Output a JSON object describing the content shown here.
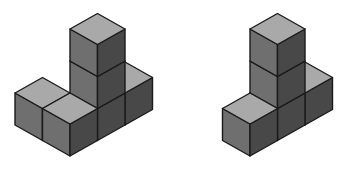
{
  "diagram": {
    "colors": {
      "background": "#ffffff",
      "top": "#a9a9a9",
      "left": "#6f6f6f",
      "right": "#484848",
      "outline": "#1a1a1a"
    },
    "projection": {
      "axis_a": [
        27.5,
        -15.5
      ],
      "axis_b": [
        -27.5,
        -15.5
      ],
      "axis_up": [
        0,
        -32
      ]
    },
    "figures": [
      {
        "name": "left-figure",
        "origin": [
          70,
          156
        ],
        "cubes": [
          [
            0,
            1,
            0
          ],
          [
            0,
            0,
            0
          ],
          [
            1,
            0,
            0
          ],
          [
            1,
            0,
            1
          ],
          [
            1,
            0,
            2
          ],
          [
            2,
            0,
            0
          ]
        ]
      },
      {
        "name": "right-figure",
        "origin": [
          250,
          156
        ],
        "cubes": [
          [
            0,
            0,
            0
          ],
          [
            1,
            0,
            0
          ],
          [
            1,
            0,
            1
          ],
          [
            1,
            0,
            2
          ],
          [
            2,
            0,
            0
          ]
        ]
      }
    ]
  }
}
